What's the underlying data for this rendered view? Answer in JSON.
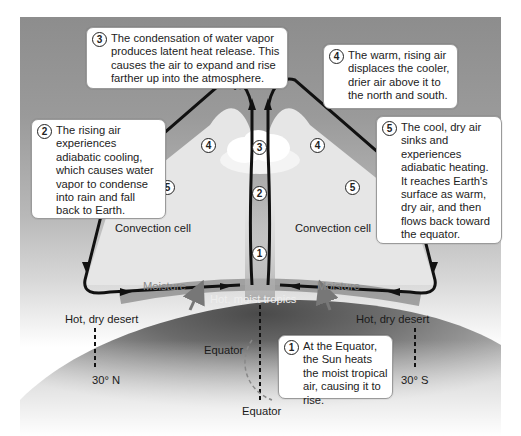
{
  "diagram": {
    "type": "hadley-cell-convection",
    "steps": [
      {
        "num": "1",
        "text": "At the Equator, the Sun heats the moist tropical air, causing it to rise."
      },
      {
        "num": "2",
        "text": "The rising air experiences adiabatic cooling, which causes water vapor to condense into rain and fall back to Earth."
      },
      {
        "num": "3",
        "text": "The condensation of water vapor produces latent heat release. This causes the air to expand and rise farther up into the atmosphere."
      },
      {
        "num": "4",
        "text": "The warm, rising air displaces the cooler, drier air above it to the north and south."
      },
      {
        "num": "5",
        "text": "The cool, dry air sinks and experiences adiabatic heating. It reaches Earth's surface as warm, dry air, and then flows back toward the equator."
      }
    ],
    "labels": {
      "dry_cold_air": "Dry, cold air",
      "convection_cell_left": "Convection cell",
      "convection_cell_right": "Convection cell",
      "moisture_left": "Moisture",
      "moisture_right": "Moisture",
      "hot_moist_tropics": "Hot, moist tropics",
      "hot_dry_desert_left": "Hot, dry desert",
      "hot_dry_desert_right": "Hot, dry desert",
      "equator_inner": "Equator",
      "equator_bottom": "Equator",
      "lat_north": "30° N",
      "lat_south": "30° S"
    },
    "path_badges": {
      "b1": "1",
      "b2": "2",
      "b3": "3",
      "b4_left": "4",
      "b4_right": "4",
      "b5_left": "5",
      "b5_right": "5"
    },
    "colors": {
      "panel_gray": "#8d8d8d",
      "cell_fill": "#e4e4e4",
      "globe_dark": "#5a5a5a",
      "arrow": "#111111",
      "moisture_text": "#8a8a8a"
    }
  }
}
